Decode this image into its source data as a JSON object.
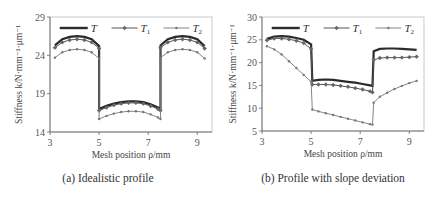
{
  "chart_data": [
    {
      "type": "line",
      "caption": "(a) Idealistic profile",
      "xlabel": "Mesh position ρ/mm",
      "ylabel": "Stiffness k/N·mm⁻¹·μm⁻¹",
      "xlim": [
        3,
        9.6
      ],
      "ylim": [
        14,
        29
      ],
      "xticks": [
        3,
        5,
        7,
        9
      ],
      "yticks": [
        14,
        19,
        24,
        29
      ],
      "legend": [
        "T",
        "T1",
        "T2"
      ],
      "legend_position": "top",
      "grid": false,
      "series": [
        {
          "name": "T",
          "style": "thick",
          "x": [
            3.2,
            3.5,
            3.8,
            4.1,
            4.4,
            4.7,
            5.0,
            5.0,
            5.3,
            5.6,
            5.9,
            6.2,
            6.5,
            6.8,
            7.1,
            7.4,
            7.5,
            7.5,
            7.8,
            8.1,
            8.4,
            8.7,
            9.0,
            9.3
          ],
          "y": [
            25.3,
            26.1,
            26.4,
            26.5,
            26.4,
            26.1,
            25.2,
            17.0,
            17.4,
            17.7,
            17.9,
            18.0,
            18.0,
            17.9,
            17.6,
            17.2,
            17.0,
            25.3,
            26.1,
            26.4,
            26.5,
            26.4,
            26.1,
            25.2
          ]
        },
        {
          "name": "T1",
          "style": "marker-diamond",
          "x": [
            3.2,
            3.5,
            3.8,
            4.1,
            4.4,
            4.7,
            5.0,
            5.0,
            5.3,
            5.6,
            5.9,
            6.2,
            6.5,
            6.8,
            7.1,
            7.4,
            7.5,
            7.5,
            7.8,
            8.1,
            8.4,
            8.7,
            9.0,
            9.3
          ],
          "y": [
            25.0,
            25.7,
            26.0,
            26.1,
            26.0,
            25.7,
            24.9,
            16.8,
            17.2,
            17.5,
            17.7,
            17.8,
            17.8,
            17.7,
            17.4,
            17.0,
            16.8,
            25.0,
            25.7,
            26.0,
            26.1,
            26.0,
            25.7,
            24.9
          ]
        },
        {
          "name": "T2",
          "style": "marker-small",
          "x": [
            3.2,
            3.5,
            3.8,
            4.1,
            4.4,
            4.7,
            5.0,
            5.0,
            5.3,
            5.6,
            5.9,
            6.2,
            6.5,
            6.8,
            7.1,
            7.4,
            7.5,
            7.5,
            7.8,
            8.1,
            8.4,
            8.7,
            9.0,
            9.3
          ],
          "y": [
            23.7,
            24.4,
            24.7,
            24.8,
            24.7,
            24.4,
            23.6,
            15.7,
            16.1,
            16.4,
            16.6,
            16.7,
            16.7,
            16.6,
            16.3,
            15.9,
            15.7,
            23.7,
            24.4,
            24.7,
            24.8,
            24.7,
            24.4,
            23.6
          ]
        }
      ]
    },
    {
      "type": "line",
      "caption": "(b) Profile with slope deviation",
      "xlabel": "Mesh position ρ/mm",
      "ylabel": "Stiffness k/N·mm⁻¹·μm⁻¹",
      "xlim": [
        3,
        9.6
      ],
      "ylim": [
        5,
        30
      ],
      "xticks": [
        3,
        5,
        7,
        9
      ],
      "yticks": [
        5,
        10,
        15,
        20,
        25,
        30
      ],
      "legend": [
        "T",
        "T1",
        "T2"
      ],
      "legend_position": "top",
      "grid": false,
      "series": [
        {
          "name": "T",
          "style": "thick",
          "x": [
            3.2,
            3.5,
            3.8,
            4.1,
            4.4,
            4.7,
            5.0,
            5.05,
            5.3,
            5.6,
            5.9,
            6.2,
            6.5,
            6.8,
            7.1,
            7.4,
            7.5,
            7.55,
            7.8,
            8.1,
            8.4,
            8.7,
            9.0,
            9.3
          ],
          "y": [
            25.2,
            25.7,
            25.8,
            25.7,
            25.4,
            25.0,
            24.0,
            16.0,
            16.2,
            16.3,
            16.2,
            16.0,
            15.8,
            15.6,
            15.3,
            15.0,
            14.9,
            22.5,
            23.0,
            23.1,
            23.1,
            23.0,
            22.9,
            22.8
          ]
        },
        {
          "name": "T1",
          "style": "marker-diamond",
          "x": [
            3.2,
            3.5,
            3.8,
            4.1,
            4.4,
            4.7,
            5.0,
            5.05,
            5.3,
            5.6,
            5.9,
            6.2,
            6.5,
            6.8,
            7.1,
            7.4,
            7.5,
            7.55,
            7.8,
            8.1,
            8.4,
            8.7,
            9.0,
            9.3
          ],
          "y": [
            24.9,
            25.3,
            25.3,
            25.1,
            24.8,
            24.3,
            23.0,
            15.2,
            15.2,
            15.2,
            15.1,
            14.9,
            14.7,
            14.4,
            14.1,
            13.7,
            13.5,
            20.6,
            21.0,
            21.1,
            21.1,
            21.1,
            21.2,
            21.3
          ]
        },
        {
          "name": "T2",
          "style": "marker-small",
          "x": [
            3.2,
            3.5,
            3.8,
            4.1,
            4.4,
            4.7,
            5.0,
            5.05,
            5.3,
            5.6,
            5.9,
            6.2,
            6.5,
            6.8,
            7.1,
            7.4,
            7.5,
            7.55,
            7.8,
            8.1,
            8.4,
            8.7,
            9.0,
            9.3
          ],
          "y": [
            23.6,
            22.9,
            21.8,
            20.3,
            18.8,
            17.3,
            15.8,
            9.7,
            9.3,
            8.9,
            8.5,
            8.1,
            7.7,
            7.3,
            6.9,
            6.5,
            6.4,
            11.2,
            12.5,
            13.4,
            14.2,
            14.9,
            15.5,
            16.0
          ]
        }
      ]
    }
  ]
}
